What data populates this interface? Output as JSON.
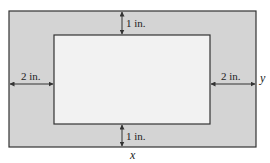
{
  "diagram": {
    "colors": {
      "border_fill": "#d4d4d4",
      "inner_fill": "#f2f2f2",
      "stroke": "#333333"
    },
    "outer_rect": {
      "x": 9,
      "y": 11,
      "w": 247,
      "h": 136
    },
    "inner_rect": {
      "x": 54,
      "y": 35,
      "w": 156,
      "h": 89
    },
    "labels": {
      "top_margin": "1 in.",
      "bottom_margin": "1 in.",
      "left_margin": "2 in.",
      "right_margin": "2 in.",
      "width_var": "x",
      "height_var": "y"
    }
  }
}
